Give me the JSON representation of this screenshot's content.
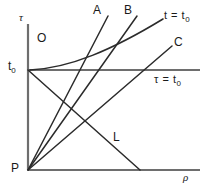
{
  "figure": {
    "type": "line-diagram",
    "background": "#ffffff",
    "stroke_color": "#2b2b2b",
    "axis_color": "#6e6e6e",
    "width": 207,
    "height": 189
  },
  "axes": {
    "vertical": {
      "label": "τ",
      "name": "tau-axis",
      "x": 28,
      "y_top": 24,
      "y_bottom": 170
    },
    "horizontal": {
      "label": "ρ",
      "name": "rho-axis",
      "y": 170,
      "x_left": 28,
      "x_right": 200
    }
  },
  "labels": {
    "tau_axis": "τ",
    "rho_axis": "ρ",
    "region_o": "O",
    "t_zero_tick": "t",
    "t_zero_tick_sub": "0",
    "vertex_p": "P",
    "line_a": "A",
    "line_b": "B",
    "line_c": "C",
    "line_l": "L",
    "curve_t_equals": "t = t",
    "curve_t_equals_sub": "0",
    "horizontal_tau_equals": "τ = t",
    "horizontal_tau_equals_sub": "0"
  },
  "points": {
    "origin_t0": {
      "x": 28,
      "y": 70,
      "name": "t-zero-point"
    },
    "vertex_p": {
      "x": 28,
      "y": 170,
      "name": "p-vertex"
    }
  },
  "lines": [
    {
      "id": "A",
      "name": "ray-a",
      "from": [
        28,
        170
      ],
      "to": [
        108,
        16
      ]
    },
    {
      "id": "B",
      "name": "ray-b",
      "from": [
        28,
        170
      ],
      "to": [
        137,
        16
      ]
    },
    {
      "id": "C",
      "name": "ray-c",
      "from": [
        28,
        170
      ],
      "to": [
        172,
        46
      ]
    },
    {
      "id": "L",
      "name": "line-l",
      "from": [
        28,
        70
      ],
      "to": [
        140,
        170
      ]
    }
  ],
  "curves": [
    {
      "id": "t_equals_t0",
      "name": "curve-t-equals-t0",
      "description": "concave-up curve tangent to tau = t0 line near origin, rising to the right",
      "path": "M 30 70 C 70 68, 110 52, 162 20"
    }
  ],
  "reference_lines": [
    {
      "id": "tau_equals_t0",
      "name": "horizontal-tau-equals-t0",
      "y": 70,
      "x_left": 28,
      "x_right": 200
    }
  ]
}
